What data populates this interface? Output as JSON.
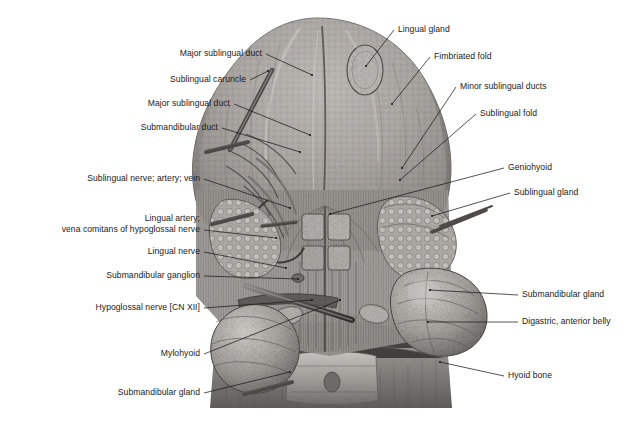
{
  "figure": {
    "background_color": "#ffffff",
    "text_color": "#1b1b1b",
    "leader_color": "#1b1b1b",
    "art_style": "grayscale stipple-and-line medical illustration"
  },
  "labels_left": [
    {
      "id": "major-sublingual-duct-upper",
      "text": "Major sublingual duct",
      "x": 262,
      "y": 57,
      "leader": [
        [
          266,
          54
        ],
        [
          312,
          75
        ]
      ]
    },
    {
      "id": "sublingual-caruncle",
      "text": "Sublingual caruncle",
      "x": 246,
      "y": 83,
      "leader": [
        [
          250,
          80
        ],
        [
          268,
          71
        ]
      ]
    },
    {
      "id": "major-sublingual-duct-lower",
      "text": "Major sublingual duct",
      "x": 230,
      "y": 107,
      "leader": [
        [
          234,
          104
        ],
        [
          310,
          135
        ]
      ]
    },
    {
      "id": "submandibular-duct",
      "text": "Submandibular duct",
      "x": 218,
      "y": 131,
      "leader": [
        [
          222,
          128
        ],
        [
          300,
          152
        ]
      ]
    },
    {
      "id": "sublingual-nerve-artery-vein",
      "text": "Sublingual nerve; artery; vein",
      "x": 200,
      "y": 182,
      "leader": [
        [
          204,
          179
        ],
        [
          290,
          208
        ]
      ]
    },
    {
      "id": "lingual-artery-vena-comitans-line1",
      "text": "Lingual artery;",
      "x": 200,
      "y": 222,
      "leader": [
        [
          204,
          230
        ],
        [
          276,
          238
        ]
      ]
    },
    {
      "id": "lingual-artery-vena-comitans-line2",
      "text": "vena comitans of hypoglossal nerve",
      "x": 200,
      "y": 233,
      "leader": null
    },
    {
      "id": "lingual-nerve",
      "text": "Lingual nerve",
      "x": 200,
      "y": 255,
      "leader": [
        [
          204,
          252
        ],
        [
          286,
          268
        ]
      ]
    },
    {
      "id": "submandibular-ganglion",
      "text": "Submandibular ganglion",
      "x": 200,
      "y": 279,
      "leader": [
        [
          204,
          276
        ],
        [
          298,
          279
        ]
      ]
    },
    {
      "id": "hypoglossal-nerve-cn-xii",
      "text": "Hypoglossal nerve [CN XII]",
      "x": 200,
      "y": 311,
      "leader": [
        [
          204,
          308
        ],
        [
          312,
          300
        ]
      ]
    },
    {
      "id": "mylohyoid",
      "text": "Mylohyoid",
      "x": 200,
      "y": 357,
      "leader": [
        [
          204,
          354
        ],
        [
          340,
          300
        ]
      ]
    },
    {
      "id": "submandibular-gland-left",
      "text": "Submandibular gland",
      "x": 200,
      "y": 396,
      "leader": [
        [
          204,
          393
        ],
        [
          290,
          372
        ]
      ]
    }
  ],
  "labels_right": [
    {
      "id": "lingual-gland",
      "text": "Lingual gland",
      "x": 398,
      "y": 33,
      "leader": [
        [
          394,
          30
        ],
        [
          366,
          66
        ]
      ]
    },
    {
      "id": "fimbriated-fold",
      "text": "Fimbriated fold",
      "x": 434,
      "y": 60,
      "leader": [
        [
          430,
          57
        ],
        [
          392,
          104
        ]
      ]
    },
    {
      "id": "minor-sublingual-ducts",
      "text": "Minor sublingual ducts",
      "x": 460,
      "y": 90,
      "leader": [
        [
          456,
          87
        ],
        [
          402,
          168
        ]
      ]
    },
    {
      "id": "sublingual-fold",
      "text": "Sublingual fold",
      "x": 480,
      "y": 117,
      "leader": [
        [
          476,
          114
        ],
        [
          400,
          180
        ]
      ]
    },
    {
      "id": "geniohyoid",
      "text": "Geniohyoid",
      "x": 508,
      "y": 171,
      "leader": [
        [
          504,
          168
        ],
        [
          330,
          214
        ]
      ]
    },
    {
      "id": "sublingual-gland-right",
      "text": "Sublingual gland",
      "x": 514,
      "y": 196,
      "leader": [
        [
          510,
          193
        ],
        [
          432,
          216
        ]
      ]
    },
    {
      "id": "submandibular-gland-right",
      "text": "Submandibular gland",
      "x": 522,
      "y": 298,
      "leader": [
        [
          518,
          295
        ],
        [
          430,
          290
        ]
      ]
    },
    {
      "id": "digastric-anterior-belly",
      "text": "Digastric, anterior belly",
      "x": 522,
      "y": 325,
      "leader": [
        [
          518,
          322
        ],
        [
          428,
          322
        ]
      ]
    },
    {
      "id": "hyoid-bone",
      "text": "Hyoid bone",
      "x": 508,
      "y": 379,
      "leader": [
        [
          504,
          376
        ],
        [
          440,
          362
        ]
      ]
    }
  ],
  "anatomy_regions": [
    {
      "name": "tongue-dorsum-inferior-surface",
      "note": "Large rounded mass occupying upper central region"
    },
    {
      "name": "lingual-gland-oval",
      "note": "Small oval gland detail near tongue apex, right of midline"
    },
    {
      "name": "genioglossus-muscle-fibers",
      "note": "Vertical striated fibers in central lower region"
    },
    {
      "name": "submandibular-gland-mass-right",
      "note": "Lobulated gland, lower right"
    },
    {
      "name": "submandibular-gland-mass-left",
      "note": "Lobulated gland, lower left"
    },
    {
      "name": "hyoid-bone-body",
      "note": "Transverse bony structure at bottom center"
    },
    {
      "name": "mylohyoid-muscle-sheet",
      "note": "Broad muscle sheet flanking midline below"
    }
  ]
}
